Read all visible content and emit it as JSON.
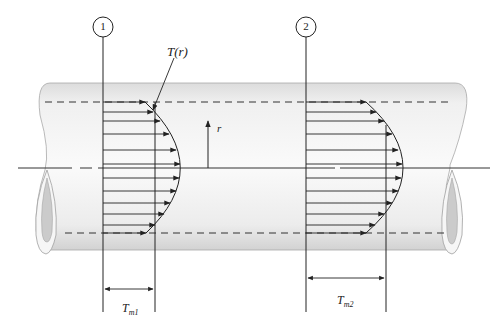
{
  "diagram": {
    "stations": [
      {
        "id": "1",
        "label": "1"
      },
      {
        "id": "2",
        "label": "2"
      }
    ],
    "labels": {
      "profile": "T(r)",
      "radius": "r",
      "tm1_main": "T",
      "tm1_sub": "m1",
      "tm2_main": "T",
      "tm2_sub": "m2"
    },
    "colors": {
      "pipe_fill_light": "#f2f2f2",
      "pipe_fill_dark": "#d6d6d6",
      "pipe_outline": "#9a9a9a",
      "inner_ellipse": "#c8c8c8",
      "line": "#222222"
    }
  }
}
